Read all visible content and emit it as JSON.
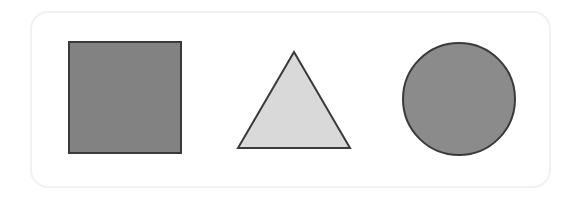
{
  "canvas": {
    "width": 582,
    "height": 200,
    "background_color": "#ffffff"
  },
  "card": {
    "name": "shape-panel",
    "x": 30,
    "y": 11,
    "width": 521,
    "height": 177,
    "border_color": "#f1f1f1",
    "border_width": 2,
    "corner_radius": 18,
    "background_color": "#ffffff"
  },
  "shapes": [
    {
      "id": "square",
      "label": "square",
      "kind": "rect",
      "x": 69,
      "y": 42,
      "width": 112,
      "height": 111,
      "fill": "#828282",
      "stroke": "#3a3a3a",
      "stroke_width": 2
    },
    {
      "id": "triangle",
      "label": "triangle",
      "kind": "polygon",
      "points": "294,52 350,148 238,148",
      "apex_x": 294,
      "apex_y": 52,
      "base_left_x": 238,
      "base_right_x": 350,
      "base_y": 148,
      "fill": "#d9d9d9",
      "stroke": "#3a3a3a",
      "stroke_width": 2
    },
    {
      "id": "circle",
      "label": "circle",
      "kind": "circle",
      "cx": 459,
      "cy": 99,
      "r": 56,
      "fill": "#8b8b8b",
      "stroke": "#3a3a3a",
      "stroke_width": 2
    }
  ]
}
